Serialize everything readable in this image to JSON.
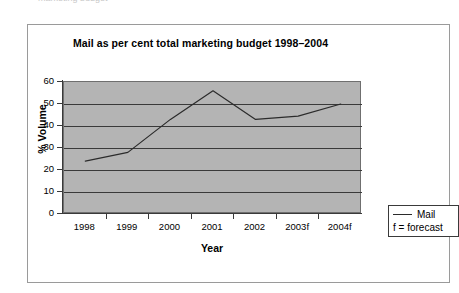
{
  "page": {
    "top_sliver_text": "marketing budget"
  },
  "figure": {
    "title": "Mail as per cent total marketing budget 1998–2004",
    "xlabel": "Year",
    "ylabel": "% Volume"
  },
  "legend": {
    "series_label": "Mail",
    "note": "f = forecast"
  },
  "colors": {
    "plot_background": "#b4b4b4",
    "line": "#2b2b2b",
    "axis": "#3a3a3a",
    "frame": "#9a9a9a",
    "text": "#000000"
  },
  "chart_data": {
    "type": "line",
    "title": "Mail as per cent total marketing budget 1998–2004",
    "xlabel": "Year",
    "ylabel": "% Volume",
    "categories": [
      "1998",
      "1999",
      "2000",
      "2001",
      "2002",
      "2003f",
      "2004f"
    ],
    "series": [
      {
        "name": "Mail",
        "values": [
          24,
          28,
          43,
          56,
          43,
          44.5,
          50
        ]
      }
    ],
    "ylim": [
      0,
      60
    ],
    "yticks": [
      0,
      10,
      20,
      30,
      40,
      50,
      60
    ],
    "ytick_labels": [
      "0",
      "10",
      "20",
      "30",
      "40",
      "50",
      "60"
    ],
    "grid": "horizontal",
    "legend_position": "outside-right-bottom",
    "annotations": [
      "f = forecast"
    ]
  }
}
